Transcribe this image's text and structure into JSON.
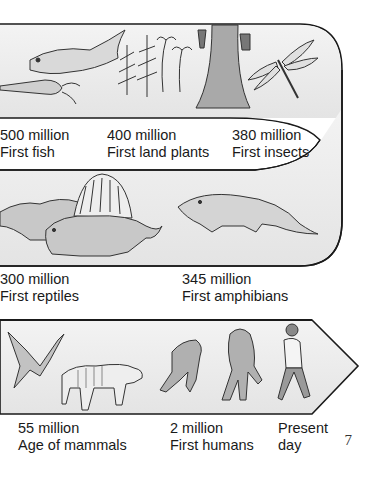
{
  "page": {
    "page_number": "7"
  },
  "timeline": {
    "row1": [
      {
        "age": "500 million",
        "event": "First fish",
        "icon": "fish-icon"
      },
      {
        "age": "400 million",
        "event": "First land plants",
        "icon": "plant-icon"
      },
      {
        "age": "380 million",
        "event": "First insects",
        "icon": "dragonfly-icon"
      }
    ],
    "row2": [
      {
        "age": "300 million",
        "event": "First reptiles",
        "icon": "reptile-icon"
      },
      {
        "age": "345 million",
        "event": "First amphibians",
        "icon": "amphibian-icon"
      }
    ],
    "row3": [
      {
        "age": "55 million",
        "event": "Age of mammals",
        "icon": "mammal-icon"
      },
      {
        "age": "2 million",
        "event": "First humans",
        "icon": "human-icon"
      },
      {
        "age": "Present",
        "event": "day",
        "icon": "walking-man-icon"
      }
    ]
  },
  "colors": {
    "band_fill": "#ececec",
    "band_stroke": "#1a1a1a",
    "text": "#1a1a1a"
  }
}
